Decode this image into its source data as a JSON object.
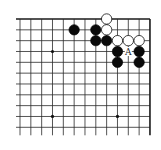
{
  "diagram": {
    "type": "go-board-fragment",
    "columns": 13,
    "rows": 11,
    "open_edges": [
      "left",
      "bottom"
    ],
    "closed_edges": [
      "top",
      "right"
    ],
    "colors": {
      "background": "#ffffff",
      "grid": "#2a2a2a",
      "black_stone": "#0a0a0a",
      "white_stone": "#ffffff"
    },
    "star_points": [
      {
        "col": 3,
        "row": 3
      },
      {
        "col": 3,
        "row": 9
      },
      {
        "col": 9,
        "row": 9
      }
    ],
    "stones": [
      {
        "color": "black",
        "col": 5,
        "row": 1
      },
      {
        "color": "black",
        "col": 7,
        "row": 1
      },
      {
        "color": "black",
        "col": 7,
        "row": 2
      },
      {
        "color": "black",
        "col": 8,
        "row": 2
      },
      {
        "color": "black",
        "col": 9,
        "row": 3
      },
      {
        "color": "black",
        "col": 11,
        "row": 3
      },
      {
        "color": "black",
        "col": 9,
        "row": 4
      },
      {
        "color": "black",
        "col": 11,
        "row": 4
      },
      {
        "color": "white",
        "col": 8,
        "row": 0
      },
      {
        "color": "white",
        "col": 8,
        "row": 1
      },
      {
        "color": "white",
        "col": 9,
        "row": 2
      },
      {
        "color": "white",
        "col": 10,
        "row": 2
      },
      {
        "color": "white",
        "col": 11,
        "row": 2
      }
    ],
    "labels": [
      {
        "text": "A",
        "col": 10,
        "row": 3
      }
    ]
  }
}
